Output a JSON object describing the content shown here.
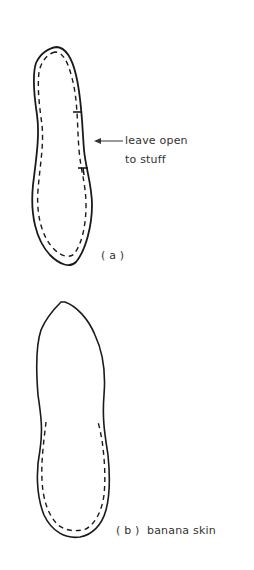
{
  "figure": {
    "panel_a": {
      "label": "( a )",
      "annotation_line1": "leave open",
      "annotation_line2": "to stuff"
    },
    "panel_b": {
      "label": "( b )  banana skin"
    },
    "colors": {
      "stroke": "#1a1a1a",
      "text": "#333333",
      "background": "#ffffff"
    }
  }
}
